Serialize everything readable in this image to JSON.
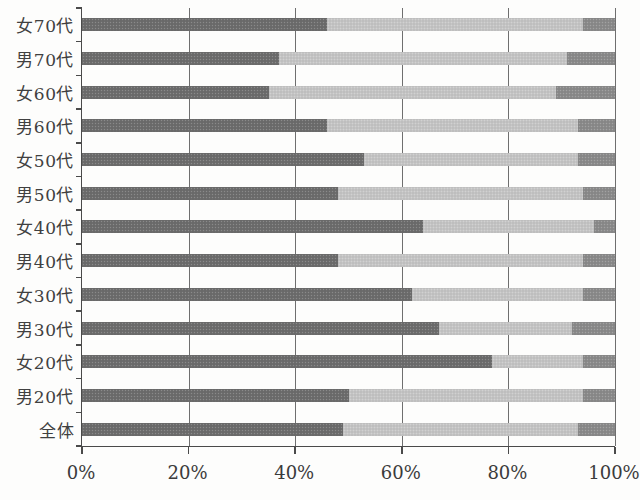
{
  "chart_data": {
    "type": "bar",
    "orientation": "horizontal",
    "stacked": true,
    "title": "",
    "xlabel": "",
    "ylabel": "",
    "legend": "none",
    "grid": true,
    "categories": [
      "女70代",
      "男70代",
      "女60代",
      "男60代",
      "女50代",
      "男50代",
      "女40代",
      "男40代",
      "女30代",
      "男30代",
      "女20代",
      "男20代",
      "全体"
    ],
    "series": [
      {
        "name": "segment-dark",
        "color": "#6d6d6d",
        "values": [
          46,
          37,
          35,
          46,
          53,
          48,
          64,
          48,
          62,
          67,
          77,
          50,
          49
        ]
      },
      {
        "name": "segment-light",
        "color": "#c5c5c5",
        "values": [
          48,
          54,
          54,
          47,
          40,
          46,
          32,
          46,
          32,
          25,
          17,
          44,
          44
        ]
      },
      {
        "name": "segment-dark-end",
        "color": "#8b8b8b",
        "values": [
          6,
          9,
          11,
          7,
          7,
          6,
          4,
          6,
          6,
          8,
          6,
          6,
          7
        ]
      }
    ],
    "x_axis": {
      "min": 0,
      "max": 100,
      "tick_step": 20,
      "tick_labels": [
        "0%",
        "20%",
        "40%",
        "60%",
        "80%",
        "100%"
      ]
    },
    "colors": {
      "axis": "#4a4a4a",
      "gridline": "#6f6f6f",
      "background": "#fdfdfc",
      "label_text": "#404040"
    }
  }
}
